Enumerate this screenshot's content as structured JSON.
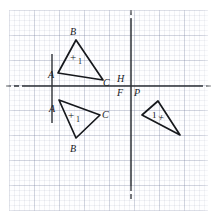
{
  "figure": {
    "type": "geometry-diagram",
    "canvas": {
      "width": 216,
      "height": 221
    },
    "grid": {
      "visible": true,
      "minor_cell_px": 5,
      "major_cell_px": 25,
      "minor_color": "#dfe3ec",
      "major_color": "#c3c9d8"
    },
    "axes": {
      "stroke_color": "#2b2f36",
      "horizontal": {
        "name": "x-axis",
        "y": 86,
        "solid_from_x": 22,
        "solid_to_x": 198,
        "dash_left": {
          "from_x": 6,
          "to_x": 22
        },
        "dash_right": {
          "from_x": 198,
          "to_x": 212
        }
      },
      "vertical": {
        "name": "y-axis",
        "x": 131,
        "solid_from_y": 18,
        "solid_to_y": 186,
        "dash_top": {
          "from_y": 10,
          "to_y": 18
        },
        "dash_bottom": {
          "from_y": 186,
          "to_y": 200
        }
      },
      "mirror_segment": {
        "name": "vertical-mirror-line",
        "x": 52,
        "from_y": 54,
        "to_y": 123
      }
    },
    "axis_labels": [
      {
        "id": "H",
        "text": "H",
        "x": 117,
        "y": 74
      },
      {
        "id": "F",
        "text": "F",
        "x": 117,
        "y": 88
      },
      {
        "id": "P",
        "text": "P",
        "x": 134,
        "y": 88
      }
    ],
    "triangles": [
      {
        "id": "upper-left-triangle",
        "name": "original-triangle",
        "orientation": "positive",
        "vertices": [
          {
            "label": "A",
            "x": 58,
            "y": 73,
            "label_x": 48,
            "label_y": 70
          },
          {
            "label": "B",
            "x": 76,
            "y": 40,
            "label_x": 70,
            "label_y": 27
          },
          {
            "label": "C",
            "x": 103,
            "y": 80,
            "label_x": 103,
            "label_y": 78
          }
        ],
        "mark": {
          "text": "+",
          "sub": "1",
          "x": 70,
          "y": 52
        }
      },
      {
        "id": "lower-left-triangle",
        "name": "reflection-across-horizontal-axis",
        "orientation": "positive",
        "vertices": [
          {
            "label": "A",
            "x": 59,
            "y": 100,
            "label_x": 49,
            "label_y": 104
          },
          {
            "label": "C",
            "x": 100,
            "y": 115,
            "label_x": 102,
            "label_y": 110
          },
          {
            "label": "B",
            "x": 76,
            "y": 138,
            "label_x": 70,
            "label_y": 144
          }
        ],
        "mark": {
          "text": "+",
          "sub": "1",
          "x": 68,
          "y": 110
        }
      },
      {
        "id": "right-triangle",
        "name": "reflection-across-vertical-axis",
        "orientation": "negative",
        "vertices": [
          {
            "label": "",
            "x": 142,
            "y": 115,
            "label_x": 0,
            "label_y": 0
          },
          {
            "label": "",
            "x": 158,
            "y": 101,
            "label_x": 0,
            "label_y": 0
          },
          {
            "label": "",
            "x": 180,
            "y": 135,
            "label_x": 0,
            "label_y": 0
          }
        ],
        "mark": {
          "text": "1",
          "sub": "+",
          "x": 156,
          "y": 112
        }
      }
    ],
    "colors": {
      "ink": "#16181c",
      "axis": "#2b2f36",
      "paper": "#ffffff"
    }
  }
}
